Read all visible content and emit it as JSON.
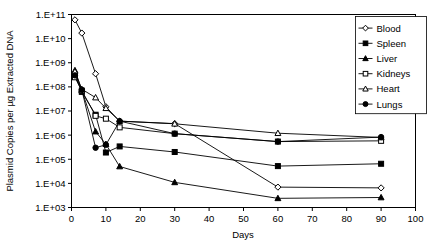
{
  "chart_data": {
    "type": "line",
    "title": "",
    "xlabel": "Days",
    "ylabel": "Plasmid Copies per µg Extracted DNA",
    "xlim": [
      0,
      100
    ],
    "ylim": [
      1000,
      100000000000
    ],
    "yscale": "log",
    "grid": false,
    "legend_position": "top-right",
    "xticks": [
      "0",
      "10",
      "20",
      "30",
      "40",
      "50",
      "60",
      "70",
      "80",
      "90",
      "100"
    ],
    "xtick_values": [
      0,
      10,
      20,
      30,
      40,
      50,
      60,
      70,
      80,
      90,
      100
    ],
    "yticks": [
      "1.E+03",
      "1.E+04",
      "1.E+05",
      "1.E+06",
      "1.E+07",
      "1.E+08",
      "1.E+09",
      "1.E+10",
      "1.E+11"
    ],
    "ytick_values": [
      1000,
      10000,
      100000,
      1000000,
      10000000,
      100000000,
      1000000000,
      10000000000,
      100000000000
    ],
    "x": [
      1,
      3,
      7,
      10,
      14,
      30,
      60,
      90
    ],
    "series": [
      {
        "name": "Blood",
        "marker": "open-diamond",
        "values": [
          60000000000,
          17000000000,
          350000000,
          15000000,
          3800000,
          3000000,
          7000,
          6500
        ]
      },
      {
        "name": "Spleen",
        "marker": "filled-square",
        "values": [
          290000000,
          62000000,
          7000000,
          190000,
          340000,
          200000,
          52000,
          65000
        ]
      },
      {
        "name": "Liver",
        "marker": "filled-triangle",
        "values": [
          480000000,
          72000000,
          1400000,
          420000,
          50000,
          11000,
          2400,
          2600
        ]
      },
      {
        "name": "Kidneys",
        "marker": "open-square",
        "values": [
          250000000,
          70000000,
          6300000,
          4800000,
          2100000,
          1150000,
          540000,
          580000
        ]
      },
      {
        "name": "Heart",
        "marker": "open-triangle",
        "values": [
          430000000,
          80000000,
          36000000,
          13000000,
          3800000,
          2950000,
          1200000,
          800000
        ]
      },
      {
        "name": "Lungs",
        "marker": "filled-circle",
        "values": [
          300000000,
          75000000,
          300000,
          400000,
          3800000,
          1150000,
          540000,
          830000
        ]
      }
    ]
  },
  "legend": {
    "items": [
      {
        "label": "Blood"
      },
      {
        "label": "Spleen"
      },
      {
        "label": "Liver"
      },
      {
        "label": "Kidneys"
      },
      {
        "label": "Heart"
      },
      {
        "label": "Lungs"
      }
    ]
  },
  "axes": {
    "x_title": "Days",
    "y_title": "Plasmid Copies per µg Extracted DNA"
  },
  "colors": {
    "ink": "#000000",
    "paper": "#ffffff"
  }
}
